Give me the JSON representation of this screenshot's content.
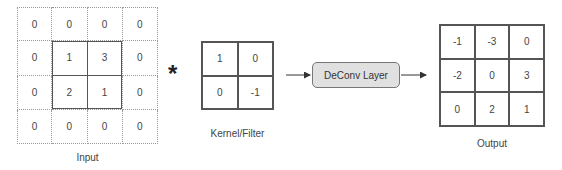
{
  "input": {
    "label": "Input",
    "matrix": [
      [
        "0",
        "0",
        "0",
        "0"
      ],
      [
        "0",
        "1",
        "3",
        "0"
      ],
      [
        "0",
        "2",
        "1",
        "0"
      ],
      [
        "0",
        "0",
        "0",
        "0"
      ]
    ]
  },
  "operator": "*",
  "kernel": {
    "label": "Kernel/Filter",
    "matrix": [
      [
        "1",
        "0"
      ],
      [
        "0",
        "-1"
      ]
    ]
  },
  "layer": {
    "label": "DeConv Layer",
    "fill": "#e0e0e0"
  },
  "output": {
    "label": "Output",
    "matrix": [
      [
        "-1",
        "-3",
        "0"
      ],
      [
        "-2",
        "0",
        "3"
      ],
      [
        "0",
        "2",
        "1"
      ]
    ]
  }
}
